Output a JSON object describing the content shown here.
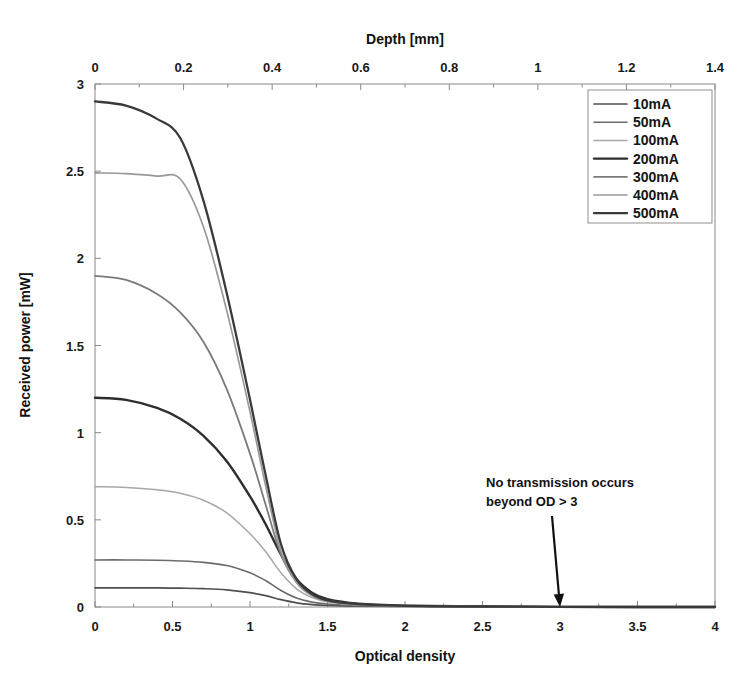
{
  "chart_data": {
    "type": "line",
    "title": "",
    "xlabel": "Optical density",
    "ylabel": "Received power [mW]",
    "secondary_xlabel": "Depth [mm]",
    "xlim": [
      0,
      4
    ],
    "ylim": [
      0,
      3
    ],
    "secondary_xlim": [
      0,
      1.4
    ],
    "xticks": [
      "0",
      "0.5",
      "1",
      "1.5",
      "2",
      "2.5",
      "3",
      "3.5",
      "4"
    ],
    "xtick_values": [
      0,
      0.5,
      1,
      1.5,
      2,
      2.5,
      3,
      3.5,
      4
    ],
    "yticks": [
      "0",
      "0.5",
      "1",
      "1.5",
      "2",
      "2.5",
      "3"
    ],
    "ytick_values": [
      0,
      0.5,
      1,
      1.5,
      2,
      2.5,
      3
    ],
    "secondary_xticks": [
      "0",
      "0.2",
      "0.4",
      "0.6",
      "0.8",
      "1",
      "1.2",
      "1.4"
    ],
    "secondary_xtick_values": [
      0,
      0.2,
      0.4,
      0.6,
      0.8,
      1.0,
      1.2,
      1.4
    ],
    "grid": false,
    "legend_position": "top-right",
    "x": [
      0,
      0.2,
      0.4,
      0.55,
      0.7,
      0.85,
      1.0,
      1.1,
      1.2,
      1.3,
      1.4,
      1.5,
      1.7,
      2.0,
      2.5,
      3.0,
      3.5,
      4.0
    ],
    "series": [
      {
        "name": "10mA",
        "color": "#4f4f4f",
        "width": 1.7,
        "values": [
          0.11,
          0.11,
          0.11,
          0.108,
          0.105,
          0.098,
          0.082,
          0.065,
          0.042,
          0.024,
          0.014,
          0.009,
          0.005,
          0.003,
          0.002,
          0.001,
          0.0,
          0.0
        ]
      },
      {
        "name": "50mA",
        "color": "#6b6b6b",
        "width": 1.6,
        "values": [
          0.27,
          0.27,
          0.268,
          0.264,
          0.256,
          0.238,
          0.196,
          0.152,
          0.095,
          0.052,
          0.028,
          0.017,
          0.008,
          0.004,
          0.002,
          0.001,
          0.0,
          0.0
        ]
      },
      {
        "name": "100mA",
        "color": "#a8a8a8",
        "width": 1.5,
        "values": [
          0.69,
          0.686,
          0.672,
          0.652,
          0.612,
          0.54,
          0.42,
          0.318,
          0.196,
          0.104,
          0.054,
          0.03,
          0.013,
          0.006,
          0.002,
          0.001,
          0.0,
          0.0
        ]
      },
      {
        "name": "200mA",
        "color": "#2e2e2e",
        "width": 2.4,
        "values": [
          1.2,
          1.188,
          1.142,
          1.08,
          0.982,
          0.836,
          0.634,
          0.476,
          0.3,
          0.16,
          0.082,
          0.045,
          0.019,
          0.008,
          0.003,
          0.001,
          0.0,
          0.0
        ]
      },
      {
        "name": "300mA",
        "color": "#7a7a7a",
        "width": 1.8,
        "values": [
          1.9,
          1.876,
          1.796,
          1.69,
          1.52,
          1.25,
          0.88,
          0.59,
          0.3,
          0.142,
          0.068,
          0.036,
          0.015,
          0.006,
          0.002,
          0.001,
          0.0,
          0.0
        ]
      },
      {
        "name": "400mA",
        "color": "#989898",
        "width": 1.7,
        "values": [
          2.49,
          2.486,
          2.472,
          2.455,
          2.18,
          1.7,
          1.12,
          0.7,
          0.32,
          0.14,
          0.064,
          0.033,
          0.014,
          0.006,
          0.002,
          0.001,
          0.0,
          0.0
        ]
      },
      {
        "name": "500mA",
        "color": "#3a3a3a",
        "width": 2.3,
        "values": [
          2.9,
          2.876,
          2.8,
          2.69,
          2.33,
          1.8,
          1.19,
          0.76,
          0.36,
          0.16,
          0.074,
          0.038,
          0.016,
          0.007,
          0.003,
          0.001,
          0.0,
          0.0
        ]
      }
    ],
    "annotations": [
      {
        "line1": "No transmission occurs",
        "line2": "beyond OD > 3",
        "target_x": 3.0,
        "target_y": 0.0
      }
    ]
  }
}
